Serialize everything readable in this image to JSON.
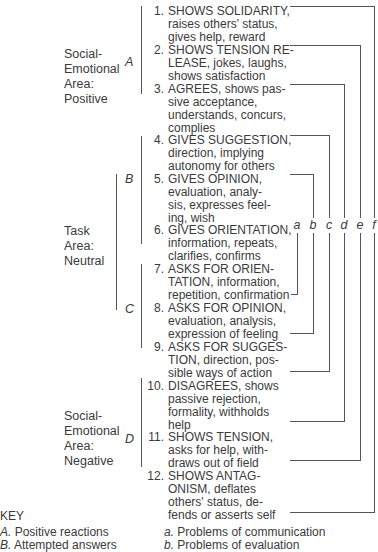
{
  "areas": [
    {
      "id": "social-emotional-positive",
      "label": "Social-\nEmotional\nArea:\nPositive",
      "lines": [
        "Social-",
        "Emotional",
        "Area:",
        "Positive"
      ]
    },
    {
      "id": "task-neutral",
      "lines": [
        "Task",
        "Area:",
        "Neutral"
      ]
    },
    {
      "id": "social-emotional-negative",
      "lines": [
        "Social-",
        "Emotional",
        "Area:",
        "Negative"
      ]
    }
  ],
  "group_letters": [
    "A",
    "B",
    "C",
    "D"
  ],
  "items": [
    {
      "num": "1.",
      "text": "SHOWS SOLIDARITY,\nraises others' status,\ngives help, reward"
    },
    {
      "num": "2.",
      "text": "SHOWS TENSION RE-\nLEASE, jokes, laughs,\nshows satisfaction"
    },
    {
      "num": "3.",
      "text": "AGREES, shows pas-\nsive acceptance,\nunderstands, concurs,\ncomplies"
    },
    {
      "num": "4.",
      "text": "GIVES SUGGESTION,\ndirection, implying\nautonomy for others"
    },
    {
      "num": "5.",
      "text": "GIVES OPINION,\nevaluation, analy-\nsis, expresses feel-\ning, wish"
    },
    {
      "num": "6.",
      "text": "GIVES ORIENTATION,\ninformation, repeats,\nclarifies, confirms"
    },
    {
      "num": "7.",
      "text": "ASKS FOR ORIEN-\nTATION, information,\nrepetition, confirmation"
    },
    {
      "num": "8.",
      "text": "ASKS FOR OPINION,\nevaluation, analysis,\nexpression of feeling"
    },
    {
      "num": "9.",
      "text": "ASKS FOR SUGGES-\nTION, direction, pos-\nsible ways of action"
    },
    {
      "num": "10.",
      "text": "DISAGREES, shows\npassive rejection,\nformality, withholds\nhelp"
    },
    {
      "num": "11.",
      "text": "SHOWS TENSION,\nasks for help, with-\ndraws out of field"
    },
    {
      "num": "12.",
      "text": "SHOWS ANTAG-\nONISM, deflates\nothers' status, de-\nfends or asserts self"
    }
  ],
  "bracket_labels": [
    "a",
    "b",
    "c",
    "d",
    "e",
    "f"
  ],
  "key": {
    "title": "KEY",
    "left": [
      {
        "letter": "A.",
        "text": "Positive reactions"
      },
      {
        "letter": "B.",
        "text": "Attempted answers"
      }
    ],
    "right": [
      {
        "letter": "a.",
        "text": "Problems of communication"
      },
      {
        "letter": "b.",
        "text": "Problems of evaluation"
      }
    ]
  }
}
